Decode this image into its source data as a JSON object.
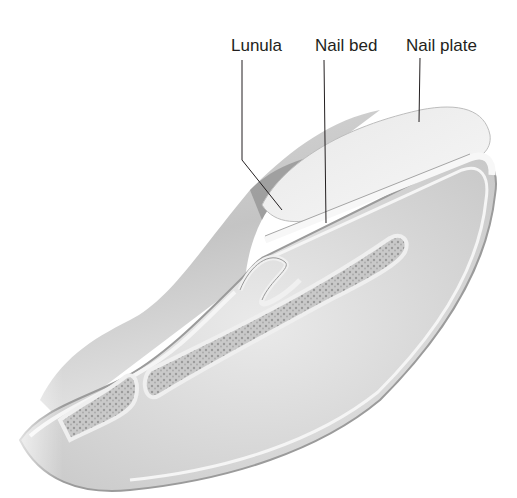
{
  "figure": {
    "labels": [
      {
        "id": "lunula",
        "text": "Lunula"
      },
      {
        "id": "nail_bed",
        "text": "Nail bed"
      },
      {
        "id": "nail_plate",
        "text": "Nail plate"
      }
    ]
  },
  "colors": {
    "background": "#ffffff",
    "label_text": "#231f20",
    "leader_line": "#231f20",
    "skin_light": "#ececec",
    "skin_mid": "#cfcfcf",
    "skin_dark": "#8e8e8e",
    "tissue": "#dcdcdc",
    "bone": "#bdbdbd",
    "nail": "#f3f3f3"
  }
}
